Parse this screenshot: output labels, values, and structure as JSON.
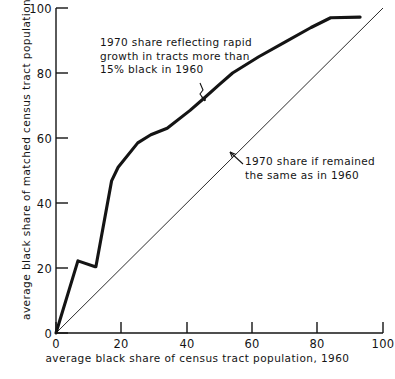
{
  "chart_data": {
    "type": "line",
    "title": "",
    "xlabel": "average black share of census tract population, 1960",
    "ylabel": "average black share of matched census tract population, 1970",
    "xlim": [
      0,
      100
    ],
    "ylim": [
      0,
      100
    ],
    "grid": false,
    "legend_position": "none",
    "xticks": [
      0,
      20,
      40,
      60,
      80,
      100
    ],
    "yticks": [
      0,
      20,
      40,
      60,
      80,
      100
    ],
    "xtick_labels": [
      "0",
      "20",
      "40",
      "60",
      "80",
      "100"
    ],
    "ytick_labels": [
      "0",
      "20",
      "40",
      "60",
      "80",
      "100"
    ],
    "series": [
      {
        "name": "1970 share reflecting rapid growth in tracts more than 15% black in 1960",
        "style": "thick",
        "x": [
          0,
          6.7,
          12.0,
          12.2,
          17.0,
          19.0,
          25.0,
          29.0,
          34.0,
          41.0,
          45.0,
          50.0,
          54.0,
          62.0,
          70.0,
          78.0,
          84.0,
          93.0
        ],
        "y": [
          0,
          22.2,
          20.4,
          20.4,
          46.8,
          51.0,
          58.5,
          61.0,
          63.0,
          68.5,
          72.0,
          76.5,
          80.0,
          85.0,
          89.5,
          94.0,
          97.0,
          97.2
        ]
      },
      {
        "name": "1970 share if remained the same as in 1960",
        "style": "thin",
        "x": [
          0,
          100
        ],
        "y": [
          0,
          100
        ]
      }
    ],
    "annotations": [
      {
        "id": "curve-note",
        "text": "1970 share reflecting rapid\ngrowth in tracts more than\n15% black in 1960",
        "points_to": [
          46,
          73
        ]
      },
      {
        "id": "diagonal-note",
        "text": "1970 share if remained\nthe same as in 1960",
        "points_to": [
          56,
          56
        ]
      }
    ]
  }
}
